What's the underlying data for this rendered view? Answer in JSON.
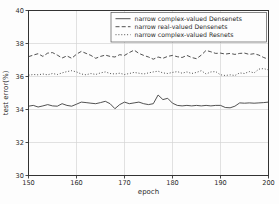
{
  "chart_data": {
    "type": "line",
    "title": "",
    "xlabel": "epoch",
    "ylabel": "test error(%)",
    "xlim": [
      150,
      200
    ],
    "ylim": [
      30,
      40
    ],
    "xticks": [
      150,
      160,
      170,
      180,
      190,
      200
    ],
    "yticks": [
      30,
      32,
      34,
      36,
      38,
      40
    ],
    "grid": true,
    "legend_position": "upper right",
    "x_step": 1,
    "series": [
      {
        "name": "narrow complex-valued Densenets",
        "line_style": "solid",
        "color": "#3d3d3d",
        "values": [
          34.2,
          34.25,
          34.15,
          34.22,
          34.3,
          34.22,
          34.2,
          34.35,
          34.25,
          34.2,
          34.32,
          34.45,
          34.42,
          34.38,
          34.35,
          34.42,
          34.5,
          34.35,
          34.05,
          34.3,
          34.45,
          34.35,
          34.4,
          34.45,
          34.35,
          34.3,
          34.35,
          34.88,
          34.6,
          34.68,
          34.38,
          34.25,
          34.22,
          34.25,
          34.22,
          34.25,
          34.22,
          34.25,
          34.22,
          34.25,
          34.25,
          34.12,
          34.1,
          34.2,
          34.4,
          34.38,
          34.4,
          34.38,
          34.4,
          34.42,
          34.45
        ]
      },
      {
        "name": "narrow real-valued Densenets",
        "line_style": "dashed",
        "color": "#3d3d3d",
        "values": [
          37.2,
          37.3,
          37.38,
          37.22,
          37.42,
          37.45,
          37.3,
          37.12,
          37.25,
          37.1,
          37.35,
          37.52,
          37.4,
          37.28,
          37.1,
          37.22,
          37.3,
          37.22,
          37.18,
          37.32,
          37.28,
          37.45,
          37.6,
          37.4,
          37.28,
          37.18,
          37.05,
          37.18,
          37.1,
          37.22,
          37.28,
          37.2,
          37.15,
          37.28,
          37.15,
          37.08,
          37.3,
          37.58,
          37.5,
          37.4,
          37.42,
          37.36,
          37.4,
          37.34,
          37.4,
          37.42,
          37.34,
          37.38,
          37.3,
          37.15,
          37.05
        ]
      },
      {
        "name": "narrow complex-valued Resnets",
        "line_style": "dotted",
        "color": "#3d3d3d",
        "values": [
          36.08,
          36.12,
          36.1,
          36.15,
          36.1,
          36.18,
          36.12,
          36.22,
          36.3,
          36.35,
          36.28,
          36.15,
          36.1,
          36.18,
          36.12,
          36.22,
          36.28,
          36.18,
          36.15,
          36.2,
          36.12,
          36.18,
          36.25,
          36.2,
          36.15,
          36.22,
          36.28,
          36.32,
          36.22,
          36.18,
          36.25,
          36.3,
          36.2,
          36.28,
          36.18,
          36.25,
          36.35,
          36.15,
          36.28,
          36.3,
          36.1,
          36.06,
          36.1,
          36.06,
          36.22,
          36.18,
          36.3,
          36.22,
          36.45,
          36.48,
          36.4
        ]
      }
    ],
    "colors": {
      "line": "#3d3d3d",
      "grid": "#d4d4d4",
      "spine": "#333333",
      "background": "#fdfdfd",
      "legend_border": "#555555"
    }
  }
}
